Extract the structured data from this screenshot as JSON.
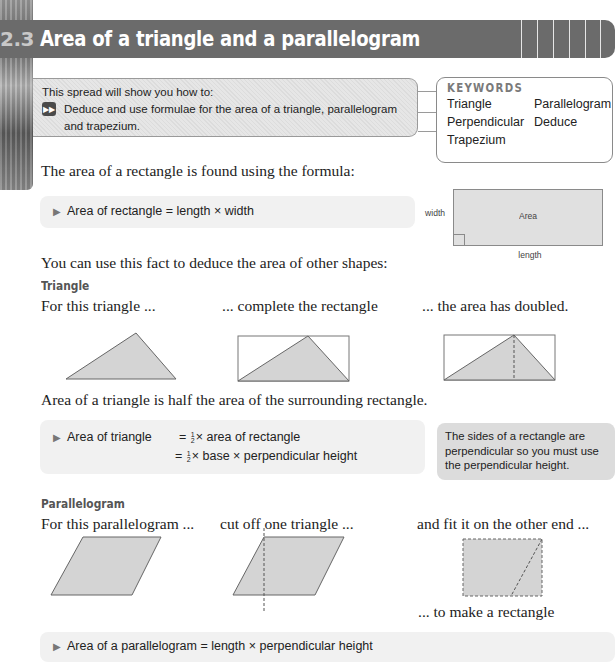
{
  "header": {
    "section_number": "2.3",
    "title": "Area of a triangle and a parallelogram"
  },
  "objectives": {
    "intro": "This spread will show you how to:",
    "items": [
      "Deduce and use formulae for the area of a triangle, parallelogram",
      "and trapezium."
    ]
  },
  "keywords": {
    "title": "KEYWORDS",
    "items": [
      "Triangle",
      "Parallelogram",
      "Perpendicular",
      "Deduce",
      "Trapezium"
    ]
  },
  "intro_text": "The area of a rectangle is found using the formula:",
  "rectangle_formula": "Area of rectangle = length × width",
  "rectangle_diagram": {
    "side_label": "width",
    "center_label": "Area",
    "bottom_label": "length"
  },
  "deduce_text": "You can use this fact to deduce the area of other shapes:",
  "triangle_section": {
    "heading": "Triangle",
    "captions": [
      "For this triangle ...",
      "... complete the rectangle",
      "... the area has doubled."
    ],
    "conclusion": "Area of a triangle is half the area of the surrounding rectangle.",
    "formula_label": "Area of triangle",
    "formula_line1": "× area of rectangle",
    "formula_line2": "× base × perpendicular height",
    "fraction_num": "1",
    "fraction_den": "2",
    "equals": "="
  },
  "note": "The sides of a rectangle are perpendicular so you must use the perpendicular height.",
  "parallelogram_section": {
    "heading": "Parallelogram",
    "captions": [
      "For this parallelogram ...",
      "cut off one triangle ...",
      "and fit it on the other end ...",
      "... to make a rectangle"
    ],
    "formula": "Area of a parallelogram = length × perpendicular height"
  },
  "colors": {
    "title_bar": "#6b6b6b",
    "shape_fill": "#d4d4d4",
    "formula_bg": "#f1f1f1",
    "note_bg": "#dcdcdc"
  }
}
